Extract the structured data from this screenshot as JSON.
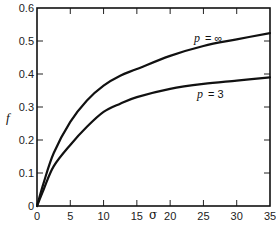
{
  "chart_data": {
    "type": "line",
    "title": "",
    "xlabel": "σ",
    "ylabel": "f",
    "xlim": [
      0,
      35
    ],
    "ylim": [
      0,
      0.6
    ],
    "grid": false,
    "legend": "none",
    "xticks": [
      0,
      5,
      10,
      15,
      20,
      25,
      30,
      35
    ],
    "xtick_labels": [
      "0",
      "5",
      "10",
      "15",
      "20",
      "25",
      "30",
      "35"
    ],
    "yticks": [
      0,
      0.1,
      0.2,
      0.3,
      0.4,
      0.5,
      0.6
    ],
    "ytick_labels": [
      "0",
      "0.1",
      "0.2",
      "0.3",
      "0.4",
      "0.5",
      "0.6"
    ],
    "series": [
      {
        "name": "p = ∞",
        "label_p": "p",
        "label_eq": "= ∞",
        "x": [
          0,
          1,
          2.5,
          5,
          7.5,
          10,
          12.5,
          15,
          20,
          25,
          30,
          35
        ],
        "y": [
          0,
          0.07,
          0.16,
          0.255,
          0.32,
          0.365,
          0.395,
          0.415,
          0.455,
          0.485,
          0.505,
          0.524
        ]
      },
      {
        "name": "p = 3",
        "label_p": "p",
        "label_eq": "= 3",
        "x": [
          0,
          1,
          2.5,
          5,
          7.5,
          10,
          12.5,
          15,
          20,
          25,
          30,
          35
        ],
        "y": [
          0,
          0.05,
          0.12,
          0.185,
          0.24,
          0.285,
          0.31,
          0.33,
          0.355,
          0.37,
          0.38,
          0.39
        ]
      }
    ]
  }
}
